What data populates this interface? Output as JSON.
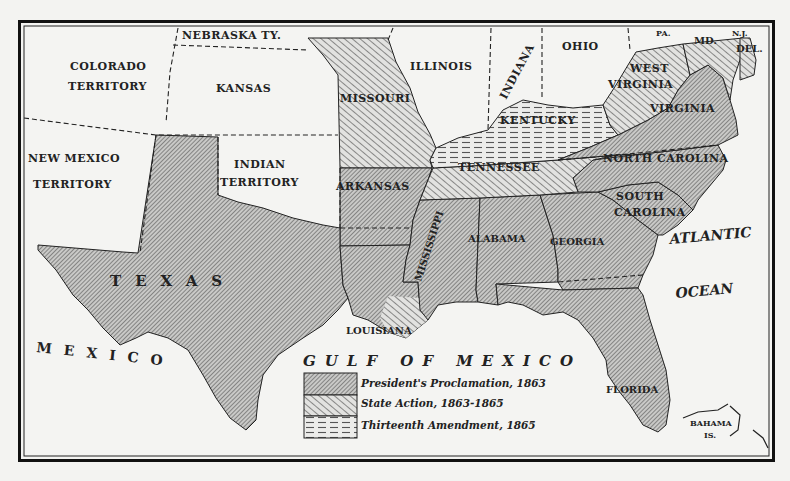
{
  "map": {
    "title_visible": false,
    "regions": {
      "colorado": {
        "line1": "COLORADO",
        "line2": "TERRITORY",
        "category": "none"
      },
      "nebraska": {
        "label": "NEBRASKA TY.",
        "category": "none"
      },
      "kansas": {
        "label": "KANSAS",
        "category": "none"
      },
      "new_mexico": {
        "line1": "NEW MEXICO",
        "line2": "TERRITORY",
        "category": "none"
      },
      "indian_territory": {
        "line1": "INDIAN",
        "line2": "TERRITORY",
        "category": "none"
      },
      "texas": {
        "label": "TEXAS",
        "category": "presidents_proclamation"
      },
      "missouri": {
        "label": "MISSOURI",
        "category": "state_action"
      },
      "arkansas": {
        "label": "ARKANSAS",
        "category": "presidents_proclamation"
      },
      "louisiana": {
        "label": "LOUISIANA",
        "category": "presidents_proclamation"
      },
      "illinois": {
        "label": "ILLINOIS",
        "category": "none"
      },
      "indiana": {
        "label": "INDIANA",
        "category": "none"
      },
      "ohio": {
        "label": "OHIO",
        "category": "none"
      },
      "pennsylvania": {
        "label": "PA.",
        "category": "none"
      },
      "maryland": {
        "label": "MD.",
        "category": "state_action"
      },
      "new_jersey": {
        "label": "N.J.",
        "category": "none"
      },
      "delaware": {
        "label": "DEL.",
        "category": "thirteenth_amendment"
      },
      "west_virginia": {
        "line1": "WEST",
        "line2": "VIRGINIA",
        "category": "state_action"
      },
      "virginia": {
        "label": "VIRGINIA",
        "category": "presidents_proclamation"
      },
      "kentucky": {
        "label": "KENTUCKY",
        "category": "thirteenth_amendment"
      },
      "tennessee": {
        "label": "TENNESSEE",
        "category": "state_action"
      },
      "north_carolina": {
        "label": "NORTH CAROLINA",
        "category": "presidents_proclamation"
      },
      "south_carolina": {
        "line1": "SOUTH",
        "line2": "CAROLINA",
        "category": "presidents_proclamation"
      },
      "mississippi": {
        "label": "MISSISSIPPI",
        "category": "presidents_proclamation"
      },
      "alabama": {
        "label": "ALABAMA",
        "category": "presidents_proclamation"
      },
      "georgia": {
        "label": "GEORGIA",
        "category": "presidents_proclamation"
      },
      "florida": {
        "label": "FLORIDA",
        "category": "presidents_proclamation"
      }
    },
    "water_labels": {
      "gulf": "GULF OF MEXICO",
      "atlantic_line1": "ATLANTIC",
      "atlantic_line2": "OCEAN",
      "mexico": "MEXICO"
    },
    "islands": {
      "line1": "BAHAMA",
      "line2": "IS."
    },
    "legend": [
      {
        "pattern": "presidents_proclamation",
        "label": "President's Proclamation, 1863"
      },
      {
        "pattern": "state_action",
        "label": "State Action, 1863-1865"
      },
      {
        "pattern": "thirteenth_amendment",
        "label": "Thirteenth Amendment, 1865"
      }
    ],
    "colors": {
      "paper": "#f3f3f1",
      "ink": "#222222",
      "dense_hatch_bg": "#b8b8b6",
      "light_hatch_bg": "#d6d6d4",
      "dash_hatch_bg": "#e6e6e4"
    }
  }
}
